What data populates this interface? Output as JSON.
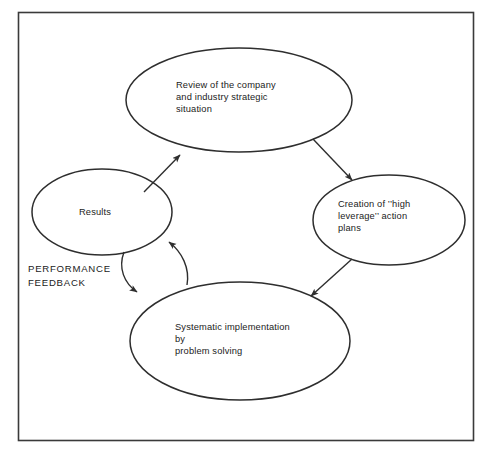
{
  "figure": {
    "background_color": "#ffffff",
    "line_color": "#2e2e2e",
    "text_color": "#1b1b1b",
    "border": {
      "name": "figure-frame",
      "color": "#3a3a3a"
    },
    "nodes": [
      {
        "id": "review",
        "label": "Review of the company\nand industry strategic\nsituation",
        "shape": "ellipse",
        "cx": 239,
        "cy": 100,
        "rx": 113,
        "ry": 52
      },
      {
        "id": "creation",
        "label": "Creation of ’’high\nleverage’’ action\nplans",
        "shape": "ellipse",
        "cx": 389,
        "cy": 220,
        "rx": 76,
        "ry": 45
      },
      {
        "id": "systematic",
        "label": "Systematic implementation\nby\nproblem solving",
        "shape": "ellipse",
        "cx": 240,
        "cy": 341,
        "rx": 110,
        "ry": 59
      },
      {
        "id": "results",
        "label": "Results",
        "shape": "ellipse",
        "cx": 102,
        "cy": 212,
        "rx": 70,
        "ry": 43
      }
    ],
    "connectors": [
      {
        "id": "review-to-creation",
        "from": "review",
        "to": "creation",
        "style": "straight",
        "arrow": "end"
      },
      {
        "id": "creation-to-systematic",
        "from": "creation",
        "to": "systematic",
        "style": "straight",
        "arrow": "end"
      },
      {
        "id": "results-to-review",
        "from": "results",
        "to": "review",
        "style": "straight",
        "arrow": "end"
      },
      {
        "id": "results-to-systematic",
        "from": "results",
        "to": "systematic",
        "style": "curved",
        "arrow": "end"
      },
      {
        "id": "systematic-to-results",
        "from": "systematic",
        "to": "results",
        "style": "curved",
        "arrow": "end"
      }
    ],
    "annotations": [
      {
        "id": "performance-feedback",
        "text": "PERFORMANCE\nFEEDBACK"
      }
    ]
  }
}
